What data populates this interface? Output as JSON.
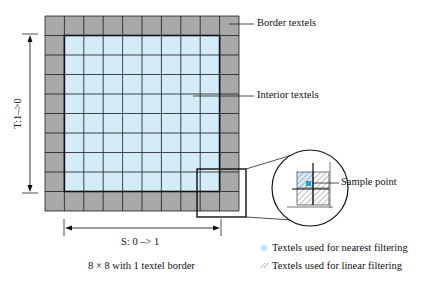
{
  "labels": {
    "border": "Border textels",
    "interior": "Interior textels",
    "sample_point": "Sample point",
    "t_axis": "T:1–>0",
    "s_axis": "S: 0 –> 1",
    "caption": "8 × 8 with 1 textel border"
  },
  "legend": [
    {
      "icon": "blue-square-icon",
      "label": "Textels used for nearest filtering"
    },
    {
      "icon": "hatch-icon",
      "label": "Textels used for linear filtering"
    }
  ],
  "colors": {
    "border_texel": "#a9a9a9",
    "interior_texel": "#d4ecf7",
    "sample_point": "#1aa3d6",
    "grid_line": "#1a1a1a"
  },
  "grid": {
    "interior": 8,
    "border": 1
  }
}
